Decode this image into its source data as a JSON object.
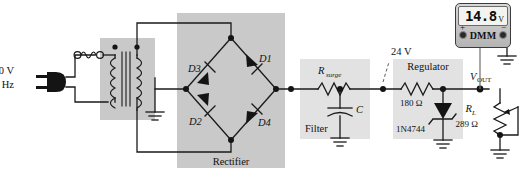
{
  "figure": {
    "type": "circuit-diagram"
  },
  "source": {
    "voltage_label": "110 V",
    "frequency_label": "60 Hz",
    "plug_icon": "ac-plug-icon",
    "fuse_icon": "fuse-icon"
  },
  "transformer": {
    "icon": "transformer-icon",
    "ground_icon": "ground-icon"
  },
  "rectifier": {
    "block_label": "Rectifier",
    "diodes": [
      {
        "id": "D1",
        "name": "diode-d1"
      },
      {
        "id": "D2",
        "name": "diode-d2"
      },
      {
        "id": "D3",
        "name": "diode-d3"
      },
      {
        "id": "D4",
        "name": "diode-d4"
      }
    ]
  },
  "filter": {
    "block_label": "Filter",
    "resistor": {
      "symbol": "R",
      "subscript": "surge"
    },
    "capacitor": {
      "symbol": "C"
    },
    "ground_icon": "ground-icon"
  },
  "annotation": {
    "node_voltage": "24 V"
  },
  "regulator": {
    "block_label": "Regulator",
    "series_resistor_value": "180 Ω",
    "zener_part_number": "1N4744",
    "zener_icon": "zener-diode-icon",
    "ground_icon": "ground-icon"
  },
  "output": {
    "label_main": "V",
    "label_sub": "OUT",
    "load": {
      "symbol": "R",
      "subscript": "L",
      "value": "289 Ω",
      "type": "potentiometer"
    },
    "ground_icon": "ground-icon"
  },
  "meter": {
    "name": "DMM",
    "reading": "14.8",
    "unit": "V",
    "positive_terminal": "+",
    "negative_terminal": "−",
    "ground_icon": "ground-icon"
  },
  "colors": {
    "wire": "#1a1a1a",
    "shade_dark": "#c9c9c9",
    "shade_light": "#e2e2e2",
    "lead": "#6e6e6e"
  }
}
